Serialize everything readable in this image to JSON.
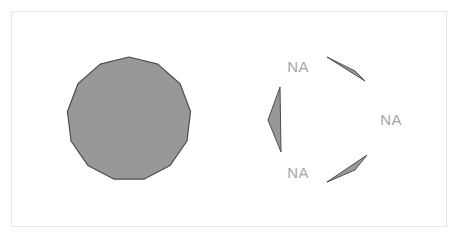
{
  "figure": {
    "title": "",
    "background_color": "#ffffff",
    "panel": {
      "border_color": "#e6e6e6",
      "fill_color": "#ffffff",
      "x": 11,
      "y": 11,
      "width": 436,
      "height": 216
    }
  },
  "chart_data": {
    "type": "diagram",
    "title": "",
    "subtitle": "",
    "xlabel": "",
    "ylabel": "",
    "grid": false,
    "legend": "none",
    "shape_fill_color": "#989898",
    "shape_stroke_color": "#4d4d4d",
    "label_color": "#a6a6a6",
    "shapes": [
      {
        "name": "filled-polygon",
        "kind": "regular-polygon",
        "sides": 13,
        "center_x": 129,
        "center_y": 119,
        "radius": 62,
        "rotation_deg": -90,
        "fill": "#989898",
        "stroke": "#4d4d4d",
        "label": ""
      },
      {
        "name": "sliver-top-right",
        "kind": "sliver",
        "points": "327,57 365,81 355,71",
        "fill": "#989898",
        "stroke": "#4d4d4d",
        "label": "NA"
      },
      {
        "name": "sliver-left",
        "kind": "sliver",
        "points": "280,87 281,152 268,120",
        "fill": "#989898",
        "stroke": "#4d4d4d",
        "label": "NA"
      },
      {
        "name": "sliver-bottom-right",
        "kind": "sliver",
        "points": "367,155 327,182 355,170",
        "fill": "#989898",
        "stroke": "#4d4d4d",
        "label": "NA"
      }
    ],
    "labels": [
      {
        "name": "na-label-top-left",
        "text": "NA",
        "x": 298,
        "y": 68,
        "anchor": "middle"
      },
      {
        "name": "na-label-right",
        "text": "NA",
        "x": 391,
        "y": 121,
        "anchor": "middle"
      },
      {
        "name": "na-label-bottom-left",
        "text": "NA",
        "x": 298,
        "y": 174,
        "anchor": "middle"
      }
    ]
  }
}
